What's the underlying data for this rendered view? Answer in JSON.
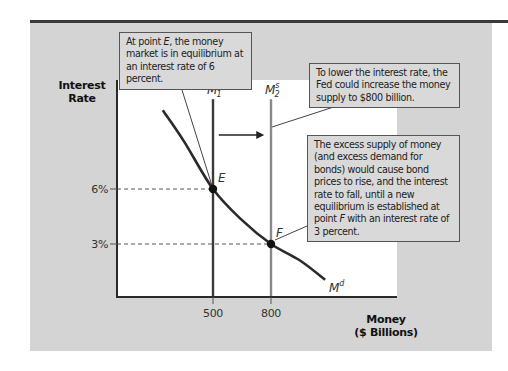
{
  "chart_data": {
    "type": "line",
    "title": "",
    "xlabel": "Money ($ Billions)",
    "xlabel_lines": [
      "Money",
      "($ Billions)"
    ],
    "ylabel": "Interest Rate",
    "ylabel_lines": [
      "Interest",
      "Rate"
    ],
    "x_ticks": [
      {
        "value": 500,
        "label": "500"
      },
      {
        "value": 800,
        "label": "800"
      }
    ],
    "y_ticks": [
      {
        "value": 6,
        "label": "6%"
      },
      {
        "value": 3,
        "label": "3%"
      }
    ],
    "xlim": [
      0,
      1450
    ],
    "ylim": [
      0,
      11.8
    ],
    "grid": false,
    "series": [
      {
        "name": "Md",
        "label_main": "M",
        "label_sup": "d",
        "kind": "demand-curve",
        "points": [
          [
            240,
            10.3
          ],
          [
            350,
            8.6
          ],
          [
            500,
            6
          ],
          [
            650,
            4.3
          ],
          [
            800,
            3
          ],
          [
            950,
            2.1
          ],
          [
            1080,
            1.05
          ]
        ],
        "color": "#2a2a2a"
      },
      {
        "name": "M1s",
        "label_main": "M",
        "label_sub": "1",
        "label_sup": "s",
        "kind": "vertical-supply",
        "x": 500,
        "y_top": 10.9,
        "color": "#3a3a3a"
      },
      {
        "name": "M2s",
        "label_main": "M",
        "label_sub": "2",
        "label_sup": "s",
        "kind": "vertical-supply",
        "x": 800,
        "y_top": 10.9,
        "color": "#8a8a8a"
      }
    ],
    "points": [
      {
        "name": "E",
        "x": 500,
        "y": 6
      },
      {
        "name": "F",
        "x": 800,
        "y": 3
      }
    ],
    "shift_arrow": {
      "from_x": 530,
      "to_x": 765,
      "y": 9.2
    },
    "annotations": [
      {
        "id": "ann-e",
        "parts": [
          [
            "At point ",
            false
          ],
          [
            "E",
            true
          ],
          [
            ", the money market is in equilibrium at an interest rate of 6 percent.",
            false
          ]
        ]
      },
      {
        "id": "ann-fed",
        "parts": [
          [
            "To lower the interest rate, the Fed could increase the money supply to $800 billion.",
            false
          ]
        ]
      },
      {
        "id": "ann-excess",
        "parts": [
          [
            "The excess supply of money (and excess demand for bonds) would cause bond prices to rise, and the interest rate to fall, until a new equilibrium is established at point ",
            false
          ],
          [
            "F",
            true
          ],
          [
            " with an interest rate of 3 percent.",
            false
          ]
        ]
      }
    ]
  },
  "colors": {
    "panel": "#d4d4d4",
    "plot_bg": "#ffffff",
    "axis": "#2a2a2a",
    "annotation_bg": "#d9d9d9",
    "m2s_line": "#8a8a8a"
  }
}
